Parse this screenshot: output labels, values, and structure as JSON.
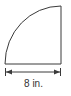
{
  "figure": {
    "shape": "quarter-circle",
    "stroke_color": "#3a3a3a",
    "dimension": {
      "label": "8 in.",
      "value": 8,
      "unit": "in."
    }
  }
}
